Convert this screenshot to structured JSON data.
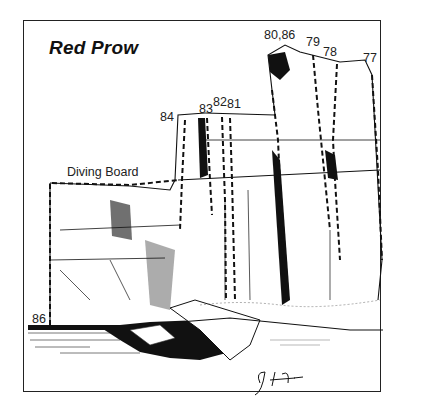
{
  "title": "Red Prow",
  "features": {
    "diving_board": "Diving Board"
  },
  "routes": [
    {
      "id": "r77",
      "label": "77"
    },
    {
      "id": "r78",
      "label": "78"
    },
    {
      "id": "r79",
      "label": "79"
    },
    {
      "id": "r80_86",
      "label": "80,86"
    },
    {
      "id": "r81",
      "label": "81"
    },
    {
      "id": "r82",
      "label": "82"
    },
    {
      "id": "r83",
      "label": "83"
    },
    {
      "id": "r84",
      "label": "84"
    },
    {
      "id": "r86_base",
      "label": "86"
    }
  ],
  "signature": "G. Abbott",
  "colors": {
    "ink": "#111111",
    "paper": "#ffffff",
    "frame": "#222222"
  }
}
